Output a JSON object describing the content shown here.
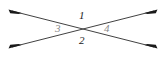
{
  "figure": {
    "background_color": "#ffffff",
    "line_color": "#2b2b2b",
    "label_dark_color": "#1a1a1a",
    "label_light_color": "#8a8a8a",
    "width": 166,
    "height": 58,
    "intersection": {
      "x": 83,
      "y": 29
    },
    "lines": [
      {
        "name": "line-down-right",
        "description": "double-headed arrow from upper-left to lower-right",
        "x1": 12,
        "y1": 11,
        "x2": 154,
        "y2": 47,
        "arrow_start": true,
        "arrow_end": true
      },
      {
        "name": "line-up-right",
        "description": "double-headed arrow from lower-left to upper-right",
        "x1": 12,
        "y1": 47,
        "x2": 154,
        "y2": 11,
        "arrow_start": true,
        "arrow_end": true
      }
    ],
    "labels": [
      {
        "id": "1",
        "text": "1",
        "position": "top",
        "x": 82,
        "y": 15,
        "shade": "dark"
      },
      {
        "id": "2",
        "text": "2",
        "position": "bottom",
        "x": 82,
        "y": 40,
        "shade": "dark"
      },
      {
        "id": "3",
        "text": "3",
        "position": "left",
        "x": 58,
        "y": 28,
        "shade": "light"
      },
      {
        "id": "4",
        "text": "4",
        "position": "right",
        "x": 107,
        "y": 28,
        "shade": "light"
      }
    ],
    "arrowheads": [
      {
        "name": "arrowhead-top-left",
        "x": 12,
        "y": 11
      },
      {
        "name": "arrowhead-top-right",
        "x": 154,
        "y": 11
      },
      {
        "name": "arrowhead-bottom-left",
        "x": 12,
        "y": 47
      },
      {
        "name": "arrowhead-bottom-right",
        "x": 154,
        "y": 47
      }
    ]
  }
}
